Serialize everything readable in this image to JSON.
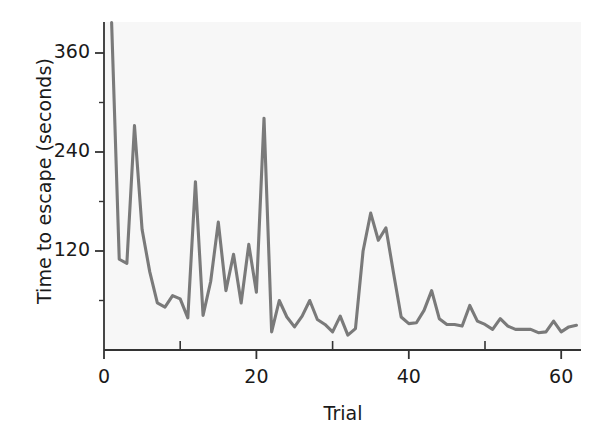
{
  "chart_data": {
    "type": "line",
    "title": "",
    "xlabel": "Trial",
    "ylabel": "Time to escape (seconds)",
    "xlim": [
      0,
      62.5
    ],
    "ylim": [
      0,
      400
    ],
    "grid": false,
    "legend": null,
    "line_color": "#7a7a7a",
    "plot_bg": "#f7f7f7",
    "axis_color": "#333333",
    "text_color": "#1a1a1a",
    "xticks": [
      0,
      20,
      40,
      60
    ],
    "xtick_labels": [
      "0",
      "20",
      "40",
      "60"
    ],
    "xminorticks": [
      10,
      30,
      50
    ],
    "yticks": [
      120,
      240,
      360
    ],
    "ytick_labels": [
      "120",
      "240",
      "360"
    ],
    "series_name": "Time to escape",
    "x": [
      1,
      2,
      3,
      4,
      5,
      6,
      7,
      8,
      9,
      10,
      11,
      12,
      13,
      14,
      15,
      16,
      17,
      18,
      19,
      20,
      21,
      22,
      23,
      24,
      25,
      26,
      27,
      28,
      29,
      30,
      31,
      32,
      33,
      34,
      35,
      36,
      37,
      38,
      39,
      40,
      41,
      42,
      43,
      44,
      45,
      46,
      47,
      48,
      49,
      50,
      51,
      52,
      53,
      54,
      55,
      56,
      57,
      58,
      59,
      60,
      61,
      62
    ],
    "values": [
      397,
      110,
      105,
      272,
      146,
      95,
      57,
      52,
      66,
      62,
      39,
      204,
      42,
      83,
      155,
      72,
      116,
      57,
      128,
      70,
      281,
      22,
      60,
      40,
      28,
      41,
      60,
      37,
      31,
      22,
      41,
      18,
      26,
      120,
      166,
      133,
      148,
      93,
      40,
      32,
      33,
      48,
      72,
      38,
      31,
      31,
      29,
      54,
      35,
      31,
      25,
      38,
      29,
      25,
      25,
      25,
      21,
      22,
      35,
      22,
      28,
      30
    ]
  }
}
